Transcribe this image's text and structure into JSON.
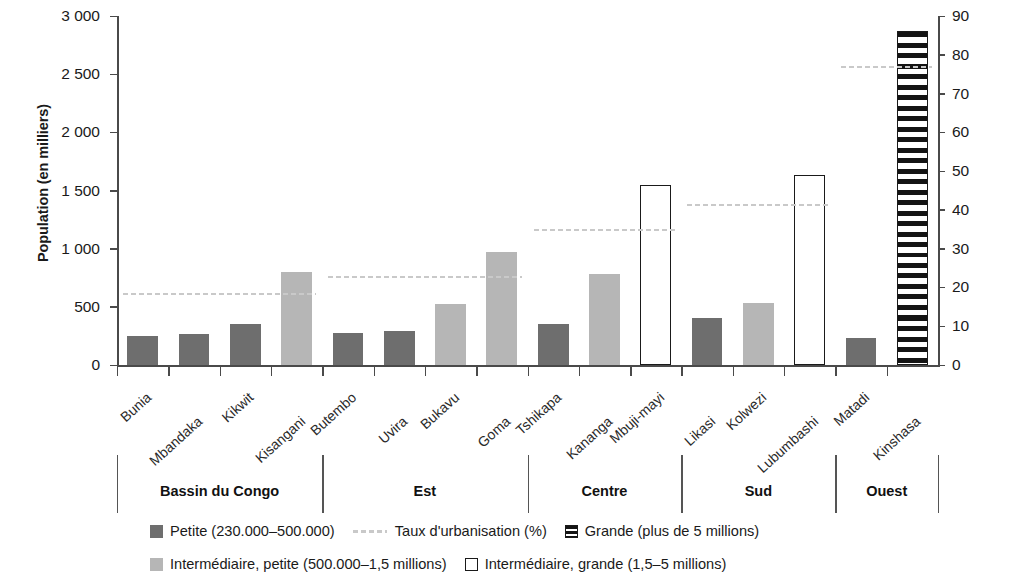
{
  "chart_data": {
    "type": "bar",
    "title": "",
    "ylabel": "Population (en milliers)",
    "ylabel_secondary": "Taux d'urbanisation de la région (%)",
    "xlabel": "",
    "ylim": [
      0,
      3000
    ],
    "ylim_secondary": [
      0,
      90
    ],
    "yticks": [
      "0",
      "500",
      "1 000",
      "1 500",
      "2 000",
      "2 500",
      "3 000"
    ],
    "yticks_secondary": [
      "0",
      "10",
      "20",
      "30",
      "40",
      "50",
      "60",
      "70",
      "80",
      "90"
    ],
    "grid": false,
    "legend_position": "bottom",
    "categories": [
      "Bunia",
      "Mbandaka",
      "Kikwit",
      "Kisangani",
      "Butembo",
      "Uvira",
      "Bukavu",
      "Goma",
      "Tshikapa",
      "Kananga",
      "Mbuji-mayi",
      "Likasi",
      "Kolwezi",
      "Lubumbashi",
      "Matadi",
      "Kinshasa"
    ],
    "values": [
      245,
      270,
      355,
      800,
      275,
      295,
      525,
      970,
      350,
      780,
      1550,
      400,
      530,
      1630,
      235,
      2870
    ],
    "bar_classes": [
      "petite",
      "petite",
      "petite",
      "inter-petite",
      "petite",
      "petite",
      "inter-petite",
      "inter-petite",
      "petite",
      "inter-petite",
      "inter-grande",
      "petite",
      "inter-petite",
      "inter-grande",
      "petite",
      "grande"
    ],
    "regions": [
      {
        "label": "Bassin du Congo",
        "cities": 4,
        "urbanisation": 18.5
      },
      {
        "label": "Est",
        "cities": 4,
        "urbanisation": 23.0
      },
      {
        "label": "Centre",
        "cities": 3,
        "urbanisation": 35.0
      },
      {
        "label": "Sud",
        "cities": 3,
        "urbanisation": 41.5
      },
      {
        "label": "Ouest",
        "cities": 2,
        "urbanisation": 77.0
      }
    ],
    "series": [
      {
        "name": "Petite (230.000–500.000)",
        "key": "petite"
      },
      {
        "name": "Intermédiaire, petite (500.000–1,5 millions)",
        "key": "inter-petite"
      },
      {
        "name": "Intermédiaire, grande (1,5–5 millions)",
        "key": "inter-grande"
      },
      {
        "name": "Grande (plus de 5 millions)",
        "key": "grande"
      },
      {
        "name": "Taux d'urbanisation (%)",
        "key": "urb"
      }
    ]
  },
  "axes": {
    "left_title": "Population (en milliers)",
    "right_title": "Taux d'urbanisation de la région (%)",
    "left_ticks": [
      "3 000",
      "2 500",
      "2 000",
      "1 500",
      "1 000",
      "500",
      "0"
    ],
    "right_ticks": [
      "90",
      "80",
      "70",
      "60",
      "50",
      "40",
      "30",
      "20",
      "10",
      "0"
    ]
  },
  "cities": [
    {
      "name": "Bunia"
    },
    {
      "name": "Mbandaka"
    },
    {
      "name": "Kikwit"
    },
    {
      "name": "Kisangani"
    },
    {
      "name": "Butembo"
    },
    {
      "name": "Uvira"
    },
    {
      "name": "Bukavu"
    },
    {
      "name": "Goma"
    },
    {
      "name": "Tshikapa"
    },
    {
      "name": "Kananga"
    },
    {
      "name": "Mbuji-mayi"
    },
    {
      "name": "Likasi"
    },
    {
      "name": "Kolwezi"
    },
    {
      "name": "Lubumbashi"
    },
    {
      "name": "Matadi"
    },
    {
      "name": "Kinshasa"
    }
  ],
  "regions": [
    {
      "label": "Bassin du Congo"
    },
    {
      "label": "Est"
    },
    {
      "label": "Centre"
    },
    {
      "label": "Sud"
    },
    {
      "label": "Ouest"
    }
  ],
  "legend": {
    "row1": [
      {
        "label": "Petite (230.000–500.000)",
        "swatch": "petite"
      },
      {
        "label": "Taux d'urbanisation (%)",
        "swatch": "urb"
      },
      {
        "label": "Grande (plus de 5 millions)",
        "swatch": "grande"
      }
    ],
    "row2": [
      {
        "label": "Intermédiaire, petite (500.000–1,5 millions)",
        "swatch": "inter-petite"
      },
      {
        "label": "Intermédiaire, grande (1,5–5 millions)",
        "swatch": "inter-grande"
      }
    ]
  }
}
